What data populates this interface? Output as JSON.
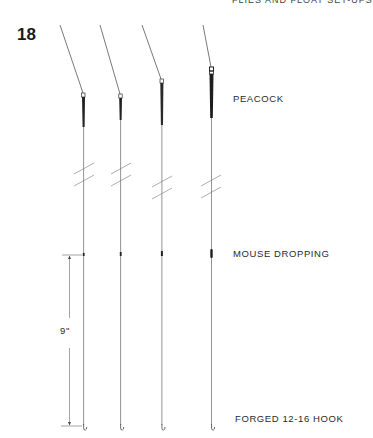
{
  "page": {
    "running_head": "FLIES AND FLOAT SET-UPS",
    "figure_number": "18"
  },
  "labels": {
    "float": "PEACOCK",
    "shot": "MOUSE DROPPING",
    "hook": "FORGED 12-16 HOOK",
    "dimension": "9\""
  },
  "rigs": [
    {
      "index": 1,
      "float": "peacock",
      "has_shot": true,
      "has_hook": true
    },
    {
      "index": 2,
      "float": "peacock",
      "has_shot": true,
      "has_hook": true
    },
    {
      "index": 3,
      "float": "peacock",
      "has_shot": true,
      "has_hook": true
    },
    {
      "index": 4,
      "float": "peacock",
      "has_shot": true,
      "has_hook": true
    }
  ],
  "colors": {
    "line": "#555555",
    "float": "#222222",
    "text": "#2a2a2a"
  }
}
